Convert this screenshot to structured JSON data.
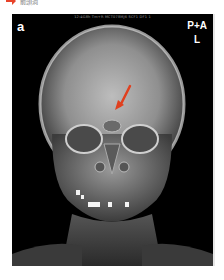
{
  "caption": {
    "arrow_icon": "red-arrow-icon",
    "text": "前頭洞",
    "arrow_color": "#e8432a"
  },
  "figure": {
    "panel_label": "a",
    "header_text": "12:4G8h Tm+R MCT078MJ6 SCF1 DF1 1",
    "orientation": {
      "view": "P+A",
      "side": "L"
    },
    "annotation_arrow_color": "#e0401f",
    "background_color": "#000000"
  }
}
